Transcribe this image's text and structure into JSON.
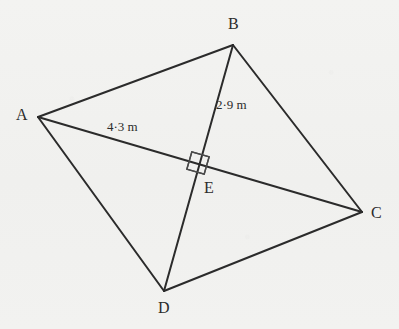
{
  "figure": {
    "kind": "quadrilateral-with-perpendicular-diagonals",
    "background_color": "#f2f2f0",
    "stroke_color": "#2b2b2b",
    "vertices": [
      {
        "id": "A",
        "label": "A",
        "x": 38,
        "y": 117
      },
      {
        "id": "B",
        "label": "B",
        "x": 233,
        "y": 45
      },
      {
        "id": "C",
        "label": "C",
        "x": 362,
        "y": 212
      },
      {
        "id": "D",
        "label": "D",
        "x": 164,
        "y": 291
      },
      {
        "id": "E",
        "label": "E",
        "x": 198,
        "y": 163
      }
    ],
    "edges": [
      {
        "id": "AB",
        "from": "A",
        "to": "B",
        "kind": "side"
      },
      {
        "id": "BC",
        "from": "B",
        "to": "C",
        "kind": "side"
      },
      {
        "id": "CD",
        "from": "C",
        "to": "D",
        "kind": "side"
      },
      {
        "id": "DA",
        "from": "D",
        "to": "A",
        "kind": "side"
      },
      {
        "id": "AC",
        "from": "A",
        "to": "C",
        "kind": "diagonal"
      },
      {
        "id": "BD",
        "from": "B",
        "to": "D",
        "kind": "diagonal"
      }
    ],
    "measurements": [
      {
        "id": "AE",
        "segment": "AE",
        "text": "4·3 m",
        "value": 4.3,
        "unit": "m"
      },
      {
        "id": "BE",
        "segment": "BE",
        "text": "2·9 m",
        "value": 2.9,
        "unit": "m"
      }
    ],
    "right_angle_marker": {
      "at": "E",
      "name": "right-angle-square",
      "size": 18
    }
  }
}
